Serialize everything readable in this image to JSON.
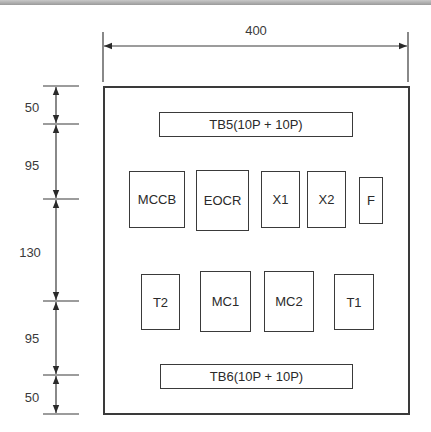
{
  "diagram": {
    "type": "panel-layout",
    "dimensions": {
      "width": "400",
      "vertical": [
        "50",
        "95",
        "130",
        "95",
        "50"
      ]
    },
    "terminal_blocks": {
      "top": "TB5(10P + 10P)",
      "bottom": "TB6(10P + 10P)"
    },
    "upper_row": [
      "MCCB",
      "EOCR",
      "X1",
      "X2",
      "F"
    ],
    "lower_row": [
      "T2",
      "MC1",
      "MC2",
      "T1"
    ]
  }
}
